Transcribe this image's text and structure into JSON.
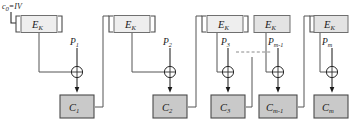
{
  "figure": {
    "iv_label": "c",
    "iv_sub": "0",
    "iv_eq": "=IV",
    "cipher_label": "E",
    "cipher_sub": "K",
    "ellipsis": "· · · · ·"
  },
  "colors": {
    "background": "#ffffff",
    "ek_fill": "#eeeeee",
    "ek_fill_shaded": "#e3e3e3",
    "c_fill": "#c9c9c9",
    "stroke": "#4a4a4a",
    "wire": "#555555",
    "text": "#1a1a1a",
    "dashed": "#8a8a8a"
  },
  "stages": [
    {
      "id": "stage-1",
      "cipher_label": "E",
      "cipher_sub": "K",
      "plain_label": "P",
      "plain_sub": "1",
      "cipher_out_label": "C",
      "cipher_out_sub": "1",
      "shaded": false
    },
    {
      "id": "stage-2",
      "cipher_label": "E",
      "cipher_sub": "K",
      "plain_label": "P",
      "plain_sub": "2",
      "cipher_out_label": "C",
      "cipher_out_sub": "2",
      "shaded": false
    },
    {
      "id": "stage-3",
      "cipher_label": "E",
      "cipher_sub": "K",
      "plain_label": "P",
      "plain_sub": "3",
      "cipher_out_label": "C",
      "cipher_out_sub": "3",
      "shaded": false
    },
    {
      "id": "stage-m-1",
      "cipher_label": "E",
      "cipher_sub": "K",
      "plain_label": "P",
      "plain_sub": "m-1",
      "cipher_out_label": "C",
      "cipher_out_sub": "m-1",
      "shaded": true
    },
    {
      "id": "stage-m",
      "cipher_label": "E",
      "cipher_sub": "K",
      "plain_label": "P",
      "plain_sub": "m",
      "cipher_out_label": "C",
      "cipher_out_sub": "m",
      "shaded": true
    }
  ],
  "operators": {
    "xor_symbol": "⊕"
  }
}
